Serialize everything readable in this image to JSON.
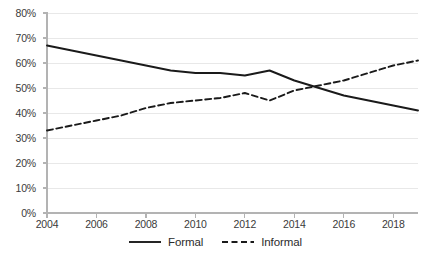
{
  "chart_data": {
    "type": "line",
    "title": "",
    "xlabel": "",
    "ylabel": "",
    "x": [
      2004,
      2005,
      2006,
      2007,
      2008,
      2009,
      2010,
      2011,
      2012,
      2013,
      2014,
      2015,
      2016,
      2017,
      2018,
      2019
    ],
    "xlim": [
      2004,
      2019
    ],
    "ylim": [
      0,
      80
    ],
    "grid": true,
    "legend_position": "bottom-center",
    "xticks": [
      2004,
      2006,
      2008,
      2010,
      2012,
      2014,
      2016,
      2018
    ],
    "xtick_labels": [
      "2004",
      "2006",
      "2008",
      "2010",
      "2012",
      "2014",
      "2016",
      "2018"
    ],
    "yticks": [
      0,
      10,
      20,
      30,
      40,
      50,
      60,
      70,
      80
    ],
    "ytick_labels": [
      "0%",
      "10%",
      "20%",
      "30%",
      "40%",
      "50%",
      "60%",
      "70%",
      "80%"
    ],
    "series": [
      {
        "name": "Formal",
        "style": "solid",
        "color": "#1a1a1a",
        "values": [
          67,
          65,
          63,
          61,
          59,
          57,
          56,
          56,
          55,
          57,
          53,
          50,
          47,
          45,
          43,
          41
        ]
      },
      {
        "name": "Informal",
        "style": "dashed",
        "color": "#1a1a1a",
        "values": [
          33,
          35,
          37,
          39,
          42,
          44,
          45,
          46,
          48,
          45,
          49,
          51,
          53,
          56,
          59,
          61
        ]
      }
    ]
  },
  "axis": {
    "y_labels": [
      "80%",
      "70%",
      "60%",
      "50%",
      "40%",
      "30%",
      "20%",
      "10%",
      "0%"
    ],
    "x_labels": [
      "2004",
      "2006",
      "2008",
      "2010",
      "2012",
      "2014",
      "2016",
      "2018"
    ]
  },
  "legend": {
    "items": [
      {
        "label": "Formal",
        "style": "solid"
      },
      {
        "label": "Informal",
        "style": "dashed"
      }
    ]
  },
  "colors": {
    "line": "#1a1a1a",
    "gridline": "#e8e8e8",
    "axis": "#b3b3b3",
    "text": "#3a3a3a"
  }
}
